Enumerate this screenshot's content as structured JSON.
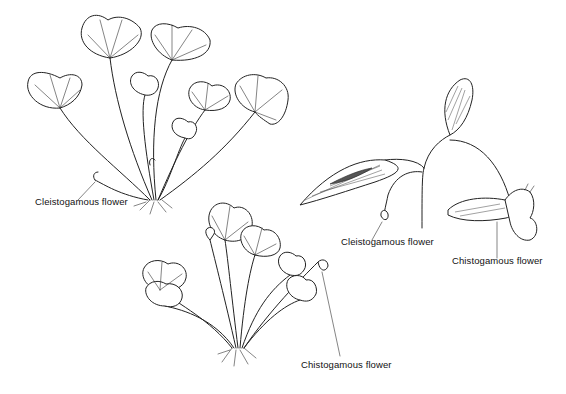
{
  "figure": {
    "panels": [
      {
        "id": "viola-plant-top-left",
        "labels": [
          {
            "text": "Cleistogamous flower",
            "x": 35,
            "y": 203
          }
        ]
      },
      {
        "id": "viola-plant-bottom-center",
        "labels": [
          {
            "text": "Chistogamous flower",
            "x": 301,
            "y": 366
          }
        ]
      },
      {
        "id": "impatiens-stem-right",
        "labels": [
          {
            "text": "Cleistogamous flower",
            "x": 341,
            "y": 243
          },
          {
            "text": "Chistogamous flower",
            "x": 452,
            "y": 262
          }
        ]
      }
    ],
    "colors": {
      "ink": "#222222",
      "background": "#ffffff"
    }
  }
}
